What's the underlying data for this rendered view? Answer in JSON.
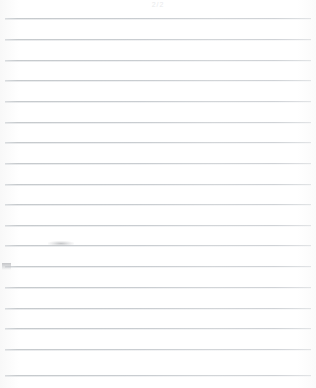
{
  "document": {
    "type": "scanned-lined-notebook-page",
    "page_label": "2/2",
    "width": 316,
    "height": 388,
    "background_color": "#fefefe",
    "is_blank": true,
    "content_text": ""
  },
  "header": {
    "mark_text": "2/2"
  },
  "ruling": {
    "line_color": "#c9cdd1",
    "line_count": 18,
    "first_line_y": 18,
    "line_spacing": 20.7,
    "left_inset": 5,
    "right_inset": 5,
    "lines_y": [
      18,
      39,
      60,
      80,
      101,
      122,
      142,
      163,
      184,
      204,
      225,
      245,
      266,
      287,
      308,
      328,
      349,
      375
    ]
  },
  "marks": [
    {
      "name": "pencil-smudge-left-lower",
      "x": 2,
      "y": 263,
      "width": 9,
      "height": 7,
      "color": "#a8aaae"
    },
    {
      "name": "pencil-smudge-upper-left",
      "x": 48,
      "y": 241,
      "width": 26,
      "height": 5,
      "color": "#c4c6c9"
    }
  ]
}
